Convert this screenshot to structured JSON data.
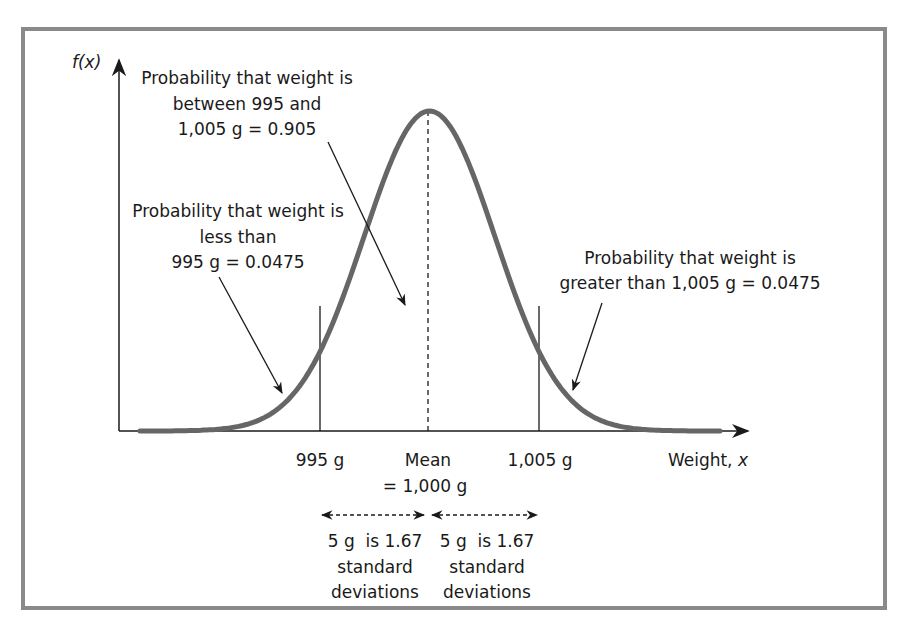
{
  "figure": {
    "type": "normal-distribution-diagram",
    "y_axis_label": "f(x)",
    "x_axis_label_prefix": "Weight, ",
    "x_axis_label_var": "x",
    "annotations": {
      "between": {
        "lines": [
          "Probability that weight is",
          "between 995 and",
          "1,005 g = 0.905"
        ]
      },
      "less_than": {
        "lines": [
          "Probability that weight is",
          "less than",
          "995 g = 0.0475"
        ]
      },
      "greater_than": {
        "lines": [
          "Probability that weight is",
          "greater than 1,005 g = 0.0475"
        ]
      }
    },
    "ticks": {
      "lower": "995 g",
      "mean_line1": "Mean",
      "mean_line2": "= 1,000 g",
      "upper": "1,005 g"
    },
    "std_dev_notes": {
      "left": [
        "5 g  is 1.67",
        "standard",
        "deviations"
      ],
      "right": [
        "5 g  is 1.67",
        "standard",
        "deviations"
      ]
    },
    "colors": {
      "frame": "#8a8a8a",
      "curve": "#666666",
      "axis": "#1a1a1a"
    }
  },
  "chart_data": {
    "type": "line",
    "title": "",
    "xlabel": "Weight, x",
    "ylabel": "f(x)",
    "distribution": "normal",
    "mean": 1000,
    "std_dev": 2.994,
    "unit": "g",
    "marked_x": [
      995,
      1000,
      1005
    ],
    "regions": [
      {
        "label": "less than 995 g",
        "probability": 0.0475
      },
      {
        "label": "between 995 and 1,005 g",
        "probability": 0.905
      },
      {
        "label": "greater than 1,005 g",
        "probability": 0.0475
      }
    ],
    "z_score": 1.67,
    "grid": false
  }
}
